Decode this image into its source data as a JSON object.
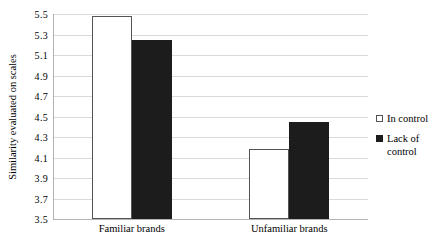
{
  "chart_data": {
    "type": "bar",
    "title": "",
    "xlabel": "",
    "ylabel": "Similarity evaluated on scales",
    "categories": [
      "Familiar brands",
      "Unfamiliar brands"
    ],
    "series": [
      {
        "name": "In control",
        "values": [
          5.48,
          4.18
        ],
        "fill": "#ffffff",
        "border": "#545454",
        "swatch": "outlined"
      },
      {
        "name": "Lack of control",
        "values": [
          5.25,
          4.45
        ],
        "fill": "#1c1c1c",
        "border": "#1c1c1c",
        "swatch": "filled"
      }
    ],
    "ylim": [
      3.5,
      5.5
    ],
    "ytick_step": 0.2,
    "ytick_labels": [
      "5.5",
      "5.3",
      "5.1",
      "4.9",
      "4.7",
      "4.5",
      "4.3",
      "4.1",
      "3.9",
      "3.7",
      "3.5"
    ],
    "grid": true,
    "legend_position": "right",
    "colors": {
      "background": "#ffffff",
      "gridline": "#dadada",
      "axis": "#b3b3b3",
      "text": "#000000"
    }
  }
}
